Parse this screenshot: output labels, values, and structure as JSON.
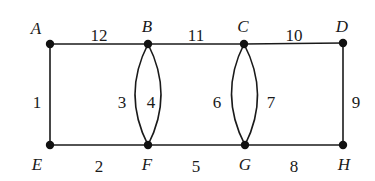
{
  "graph": {
    "vertices": [
      {
        "id": "A",
        "label": "A",
        "x": 50,
        "y": 44,
        "lx": 36,
        "ly": 34
      },
      {
        "id": "B",
        "label": "B",
        "x": 148,
        "y": 44,
        "lx": 147,
        "ly": 32
      },
      {
        "id": "C",
        "label": "C",
        "x": 244,
        "y": 44,
        "lx": 243,
        "ly": 32
      },
      {
        "id": "D",
        "label": "D",
        "x": 343,
        "y": 43,
        "lx": 342,
        "ly": 32
      },
      {
        "id": "E",
        "label": "E",
        "x": 50,
        "y": 145,
        "lx": 37,
        "ly": 170
      },
      {
        "id": "F",
        "label": "F",
        "x": 148,
        "y": 145,
        "lx": 147,
        "ly": 170
      },
      {
        "id": "G",
        "label": "G",
        "x": 245,
        "y": 145,
        "lx": 245,
        "ly": 170
      },
      {
        "id": "H",
        "label": "H",
        "x": 343,
        "y": 145,
        "lx": 344,
        "ly": 170
      }
    ],
    "edges": [
      {
        "from": "A",
        "to": "B",
        "label": "12",
        "type": "straight",
        "lx": 99,
        "ly": 35
      },
      {
        "from": "B",
        "to": "C",
        "label": "11",
        "type": "straight",
        "lx": 196,
        "ly": 35
      },
      {
        "from": "C",
        "to": "D",
        "label": "10",
        "type": "straight",
        "lx": 294,
        "ly": 35
      },
      {
        "from": "A",
        "to": "E",
        "label": "1",
        "type": "straight",
        "lx": 37,
        "ly": 102
      },
      {
        "from": "D",
        "to": "H",
        "label": "9",
        "type": "straight",
        "lx": 356,
        "ly": 102
      },
      {
        "from": "E",
        "to": "F",
        "label": "2",
        "type": "straight",
        "lx": 99,
        "ly": 166
      },
      {
        "from": "F",
        "to": "G",
        "label": "5",
        "type": "straight",
        "lx": 196,
        "ly": 166
      },
      {
        "from": "G",
        "to": "H",
        "label": "8",
        "type": "straight",
        "lx": 294,
        "ly": 166
      },
      {
        "from": "B",
        "to": "F",
        "label": "3",
        "type": "curve-left",
        "lx": 122,
        "ly": 102
      },
      {
        "from": "B",
        "to": "F",
        "label": "4",
        "type": "curve-right",
        "lx": 151,
        "ly": 102
      },
      {
        "from": "C",
        "to": "G",
        "label": "6",
        "type": "curve-left",
        "lx": 217,
        "ly": 102
      },
      {
        "from": "C",
        "to": "G",
        "label": "7",
        "type": "curve-right",
        "lx": 271,
        "ly": 102
      }
    ]
  }
}
